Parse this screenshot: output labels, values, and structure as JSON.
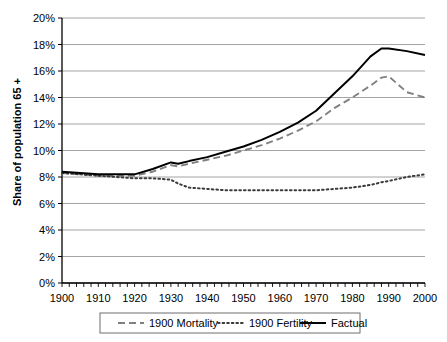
{
  "chart_data": {
    "type": "line",
    "title": "",
    "xlabel": "",
    "ylabel": "Share of population 65 +",
    "xlim": [
      1900,
      2000
    ],
    "ylim": [
      0,
      20
    ],
    "ytick_labels": [
      "0%",
      "2%",
      "4%",
      "6%",
      "8%",
      "10%",
      "12%",
      "14%",
      "16%",
      "18%",
      "20%"
    ],
    "ytick_values": [
      0,
      2,
      4,
      6,
      8,
      10,
      12,
      14,
      16,
      18,
      20
    ],
    "xtick_labels": [
      "1900",
      "1910",
      "1920",
      "1930",
      "1940",
      "1950",
      "1960",
      "1970",
      "1980",
      "1990",
      "2000"
    ],
    "xtick_values": [
      1900,
      1910,
      1920,
      1930,
      1940,
      1950,
      1960,
      1970,
      1980,
      1990,
      2000
    ],
    "minor_xtick_step": 2,
    "grid": "horizontal",
    "legend_position": "bottom",
    "x": [
      1900,
      1905,
      1910,
      1915,
      1920,
      1925,
      1930,
      1932,
      1935,
      1940,
      1945,
      1950,
      1955,
      1960,
      1965,
      1970,
      1975,
      1980,
      1985,
      1988,
      1990,
      1995,
      2000
    ],
    "series": [
      {
        "name": "1900 Mortality",
        "style": "dashed",
        "color": "#808080",
        "values": [
          8.3,
          8.2,
          8.1,
          8.1,
          8.1,
          8.4,
          8.9,
          8.8,
          9.0,
          9.3,
          9.6,
          10.0,
          10.4,
          10.9,
          11.5,
          12.2,
          13.2,
          14.0,
          14.9,
          15.5,
          15.6,
          14.4,
          14.0
        ]
      },
      {
        "name": "1900 Fertility",
        "style": "dotted",
        "color": "#3a3a3a",
        "values": [
          8.3,
          8.2,
          8.1,
          8.0,
          7.9,
          7.9,
          7.8,
          7.5,
          7.2,
          7.1,
          7.0,
          7.0,
          7.0,
          7.0,
          7.0,
          7.0,
          7.1,
          7.2,
          7.4,
          7.6,
          7.7,
          8.0,
          8.2
        ]
      },
      {
        "name": "Factual",
        "style": "solid",
        "color": "#000000",
        "values": [
          8.4,
          8.3,
          8.2,
          8.2,
          8.2,
          8.6,
          9.1,
          9.0,
          9.2,
          9.5,
          9.9,
          10.3,
          10.8,
          11.4,
          12.1,
          13.0,
          14.3,
          15.6,
          17.1,
          17.7,
          17.7,
          17.5,
          17.2
        ]
      }
    ],
    "legend": [
      {
        "label": "1900 Mortality",
        "style": "dashed",
        "color": "#808080"
      },
      {
        "label": "1900 Fertility",
        "style": "dotted",
        "color": "#3a3a3a"
      },
      {
        "label": "Factual",
        "style": "solid",
        "color": "#000000"
      }
    ]
  },
  "axes": {
    "left_px": 62,
    "right_px": 425,
    "top_px": 18,
    "bottom_px": 283
  }
}
